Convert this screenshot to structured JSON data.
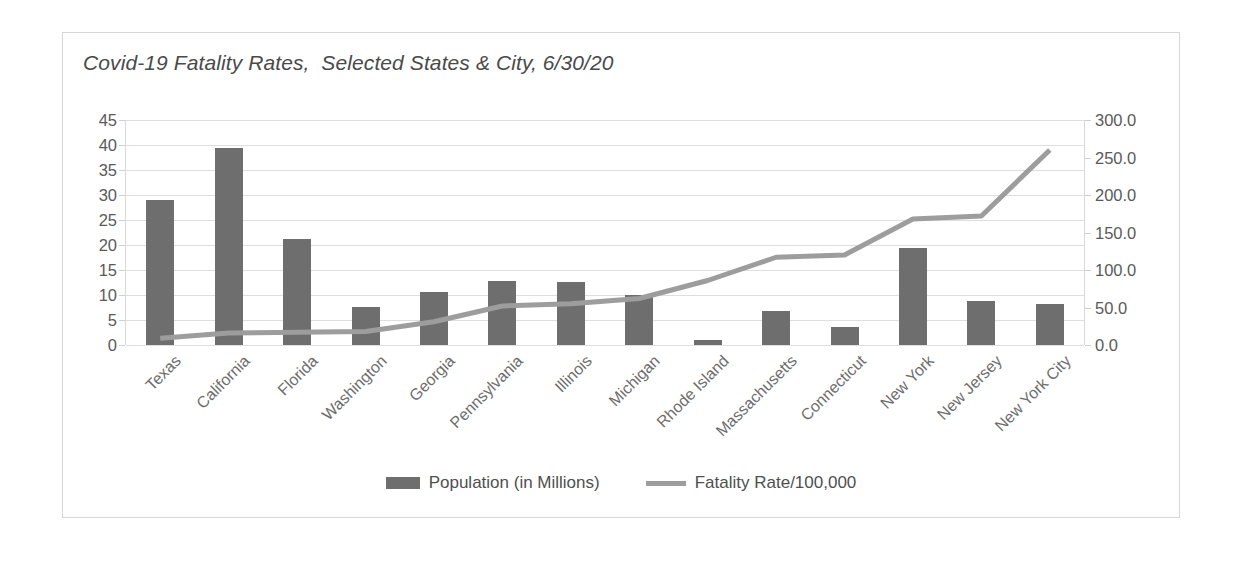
{
  "chart_data": {
    "type": "bar",
    "title": "Covid-19 Fatality Rates,  Selected States & City, 6/30/20",
    "xlabel": "",
    "ylabel": "",
    "grid": true,
    "legend_position": "bottom",
    "categories": [
      "Texas",
      "California",
      "Florida",
      "Washington",
      "Georgia",
      "Pennsylvania",
      "Illinois",
      "Michigan",
      "Rhode Island",
      "Massachusetts",
      "Connecticut",
      "New York",
      "New Jersey",
      "New York City"
    ],
    "series": [
      {
        "name": "Population (in Millions)",
        "type": "bar",
        "axis": "left",
        "color": "#6e6e6e",
        "values": [
          29.0,
          39.5,
          21.2,
          7.6,
          10.6,
          12.8,
          12.7,
          10.0,
          1.1,
          6.9,
          3.6,
          19.4,
          8.9,
          8.3
        ]
      },
      {
        "name": "Fatality Rate/100,000",
        "type": "line",
        "axis": "right",
        "color": "#9d9d9d",
        "values": [
          9.0,
          16.0,
          17.0,
          18.0,
          31.0,
          52.0,
          55.0,
          62.0,
          86.0,
          117.0,
          120.0,
          168.0,
          172.0,
          260.0
        ]
      }
    ],
    "axis_left": {
      "ticks": [
        "45",
        "40",
        "35",
        "30",
        "25",
        "20",
        "15",
        "10",
        "5",
        "0"
      ],
      "min": 0,
      "max": 45,
      "step": 5
    },
    "axis_right": {
      "ticks": [
        "300.0",
        "250.0",
        "200.0",
        "150.0",
        "100.0",
        "50.0",
        "0.0"
      ],
      "min": 0,
      "max": 300,
      "step": 50
    }
  },
  "legend": {
    "items": [
      {
        "label": "Population (in Millions)",
        "swatch": "bar-swatch"
      },
      {
        "label": "Fatality Rate/100,000",
        "swatch": "line-swatch"
      }
    ]
  }
}
